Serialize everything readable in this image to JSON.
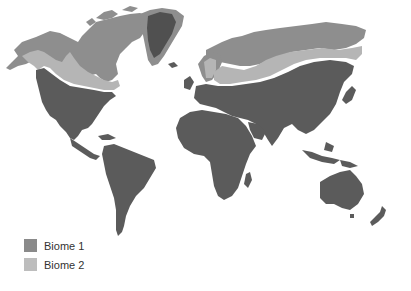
{
  "map": {
    "type": "world-biome-map",
    "colors": {
      "biome1": "#5b5b5b",
      "biome2": "#b5b5b5",
      "polar": "#8e8e8e",
      "ocean": "#ffffff"
    }
  },
  "legend": {
    "items": [
      {
        "label": "Biome 1",
        "color": "#8a8a8a"
      },
      {
        "label": "Biome 2",
        "color": "#bdbdbd"
      }
    ]
  }
}
